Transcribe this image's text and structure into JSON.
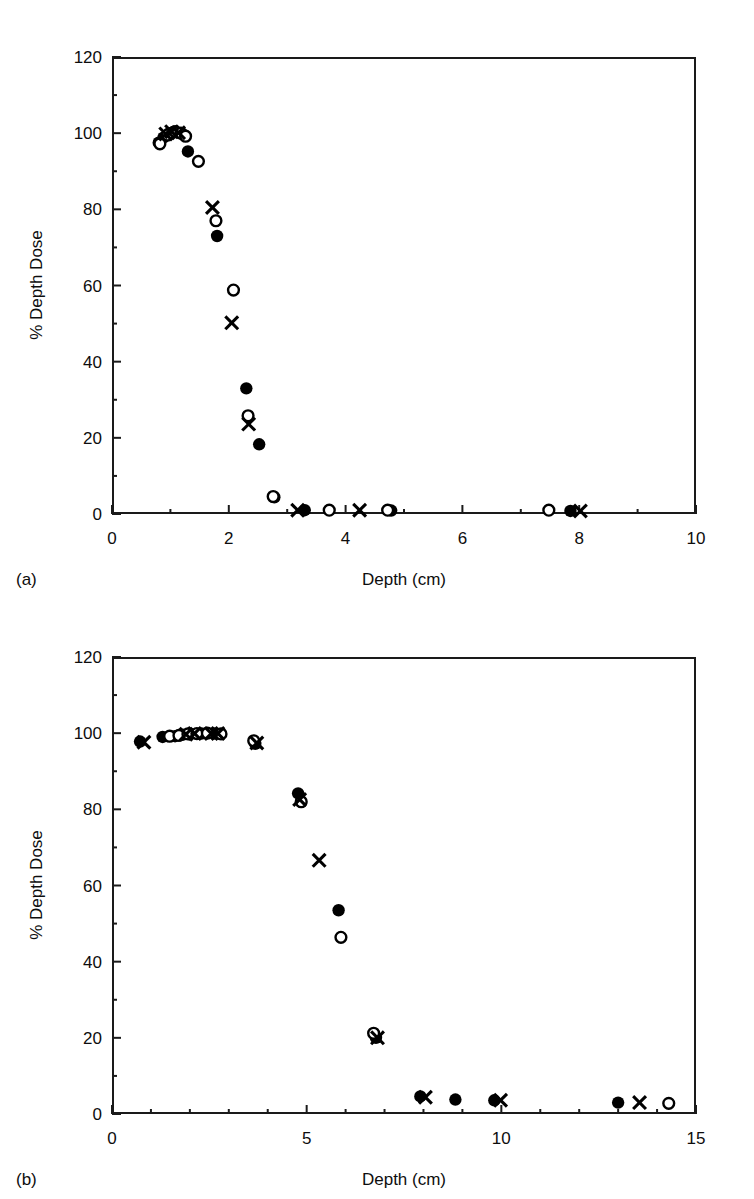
{
  "figure": {
    "panels": [
      {
        "id": "a",
        "panel_label": "(a)",
        "xlabel": "Depth (cm)",
        "ylabel": "% Depth Dose"
      },
      {
        "id": "b",
        "panel_label": "(b)",
        "xlabel": "Depth  (cm)",
        "ylabel": "% Depth Dose"
      }
    ]
  },
  "chart_data": [
    {
      "type": "scatter",
      "panel": "(a)",
      "title": "",
      "xlabel": "Depth (cm)",
      "ylabel": "% Depth Dose",
      "xlim": [
        0,
        10
      ],
      "ylim": [
        0,
        120
      ],
      "xticks": [
        0,
        2,
        4,
        6,
        8,
        10
      ],
      "xtick_labels": [
        "0",
        "2",
        "4",
        "6",
        "8",
        "10"
      ],
      "xminor_step": 1,
      "yticks": [
        0,
        20,
        40,
        60,
        80,
        100,
        120
      ],
      "ytick_labels": [
        "0",
        "20",
        "40",
        "60",
        "80",
        "100",
        "120"
      ],
      "yminor_step": 10,
      "grid": false,
      "legend": "none",
      "series": [
        {
          "name": "filled-circle",
          "marker": "filled-circle",
          "color": "#000000",
          "points": [
            [
              0.8,
              97.5
            ],
            [
              0.88,
              98.8
            ],
            [
              0.98,
              100.0
            ],
            [
              1.05,
              100.3
            ],
            [
              1.12,
              100.2
            ],
            [
              1.22,
              99.6
            ],
            [
              1.3,
              95.2
            ],
            [
              1.8,
              73.0
            ],
            [
              2.3,
              33.0
            ],
            [
              2.52,
              18.3
            ],
            [
              2.78,
              4.4
            ],
            [
              3.3,
              1.0
            ],
            [
              4.78,
              0.9
            ],
            [
              7.85,
              0.8
            ]
          ]
        },
        {
          "name": "open-circle",
          "marker": "open-circle",
          "color": "#000000",
          "points": [
            [
              0.82,
              97.2
            ],
            [
              0.95,
              99.5
            ],
            [
              1.08,
              100.4
            ],
            [
              1.18,
              100.0
            ],
            [
              1.26,
              99.2
            ],
            [
              1.48,
              92.6
            ],
            [
              1.78,
              77.0
            ],
            [
              2.08,
              58.8
            ],
            [
              2.33,
              25.8
            ],
            [
              2.76,
              4.6
            ],
            [
              3.72,
              1.0
            ],
            [
              4.72,
              1.0
            ],
            [
              7.48,
              1.0
            ]
          ]
        },
        {
          "name": "cross",
          "marker": "cross",
          "color": "#000000",
          "points": [
            [
              0.92,
              99.8
            ],
            [
              1.02,
              100.4
            ],
            [
              1.14,
              100.1
            ],
            [
              1.72,
              80.5
            ],
            [
              2.05,
              50.2
            ],
            [
              2.34,
              23.6
            ],
            [
              3.18,
              1.0
            ],
            [
              4.24,
              1.0
            ],
            [
              8.02,
              0.8
            ]
          ]
        }
      ]
    },
    {
      "type": "scatter",
      "panel": "(b)",
      "title": "",
      "xlabel": "Depth  (cm)",
      "ylabel": "% Depth Dose",
      "xlim": [
        0,
        15
      ],
      "ylim": [
        0,
        120
      ],
      "xticks": [
        0,
        5,
        10,
        15
      ],
      "xtick_labels": [
        "0",
        "5",
        "10",
        "15"
      ],
      "xminor_step": 1,
      "yticks": [
        0,
        20,
        40,
        60,
        80,
        100,
        120
      ],
      "ytick_labels": [
        "0",
        "20",
        "40",
        "60",
        "80",
        "100",
        "120"
      ],
      "yminor_step": 10,
      "grid": false,
      "legend": "none",
      "series": [
        {
          "name": "filled-circle",
          "marker": "filled-circle",
          "color": "#000000",
          "points": [
            [
              0.72,
              97.8
            ],
            [
              1.3,
              99.0
            ],
            [
              1.62,
              99.2
            ],
            [
              1.82,
              99.6
            ],
            [
              2.02,
              99.8
            ],
            [
              2.3,
              99.9
            ],
            [
              2.62,
              99.9
            ],
            [
              3.68,
              97.2
            ],
            [
              4.78,
              84.2
            ],
            [
              5.82,
              53.5
            ],
            [
              6.78,
              20.0
            ],
            [
              7.92,
              4.6
            ],
            [
              8.82,
              3.8
            ],
            [
              9.82,
              3.6
            ],
            [
              13.0,
              3.0
            ]
          ]
        },
        {
          "name": "open-circle",
          "marker": "open-circle",
          "color": "#000000",
          "points": [
            [
              1.48,
              99.2
            ],
            [
              1.72,
              99.4
            ],
            [
              1.95,
              99.8
            ],
            [
              2.18,
              99.9
            ],
            [
              2.45,
              100.0
            ],
            [
              2.8,
              99.8
            ],
            [
              3.64,
              98.0
            ],
            [
              4.86,
              82.0
            ],
            [
              5.88,
              46.4
            ],
            [
              6.72,
              21.2
            ],
            [
              14.3,
              2.8
            ]
          ]
        },
        {
          "name": "cross",
          "marker": "cross",
          "color": "#000000",
          "points": [
            [
              0.82,
              97.6
            ],
            [
              1.9,
              99.7
            ],
            [
              2.12,
              99.9
            ],
            [
              2.55,
              99.9
            ],
            [
              2.72,
              99.9
            ],
            [
              3.72,
              97.4
            ],
            [
              4.82,
              82.6
            ],
            [
              5.32,
              66.6
            ],
            [
              6.82,
              20.0
            ],
            [
              8.05,
              4.4
            ],
            [
              9.98,
              3.6
            ],
            [
              13.55,
              3.0
            ]
          ]
        }
      ]
    }
  ]
}
